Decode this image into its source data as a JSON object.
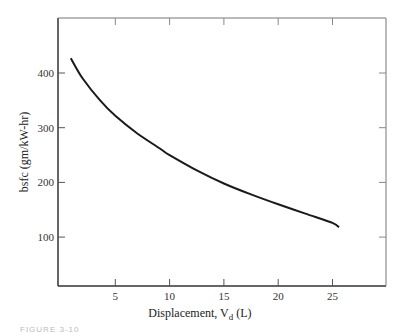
{
  "chart_data": {
    "type": "line",
    "title": "",
    "xlabel": "Displacement, V_d (L)",
    "xlabel_main": "Displacement, V",
    "xlabel_sub": "d",
    "xlabel_unit": " (L)",
    "ylabel": "bsfc (gm/kW-hr)",
    "xlim": [
      0,
      30
    ],
    "ylim": [
      10,
      500
    ],
    "xticks": [
      5,
      10,
      15,
      20,
      25
    ],
    "yticks": [
      100,
      200,
      300,
      400
    ],
    "xtick_labels": [
      "5",
      "10",
      "15",
      "20",
      "25"
    ],
    "ytick_labels": [
      "100",
      "200",
      "300",
      "400"
    ],
    "grid": false,
    "legend": null,
    "series": [
      {
        "name": "bsfc",
        "color": "#1a1a1a",
        "x": [
          0.9,
          2,
          3.6,
          5,
          7,
          9.1,
          10,
          12.5,
          15,
          17.5,
          20,
          22.5,
          25,
          25.6
        ],
        "y": [
          427,
          390,
          350,
          322,
          290,
          262,
          250,
          222,
          198,
          178,
          160,
          143,
          126,
          118
        ]
      }
    ]
  },
  "caption": "FIGURE 3-10"
}
